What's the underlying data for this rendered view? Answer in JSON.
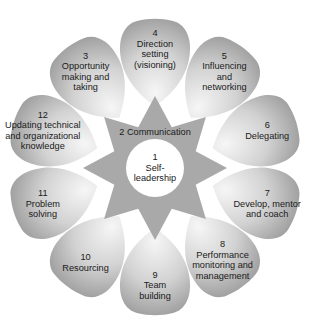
{
  "diagram": {
    "type": "competency-flower",
    "colors": {
      "petal_light": "#f4f4f4",
      "petal_dark": "#9a9a9a",
      "star": "#a8a8a8",
      "center": "#ffffff",
      "text": "#1a1a1a"
    },
    "center": {
      "number": "1",
      "lines": [
        "1",
        "Self-",
        "leadership"
      ]
    },
    "star": {
      "label": "2 Communication"
    },
    "petals": [
      {
        "number": "4",
        "lines": [
          "4",
          "Direction",
          "setting",
          "(visioning)"
        ]
      },
      {
        "number": "5",
        "lines": [
          "5",
          "Influencing",
          "and",
          "networking"
        ]
      },
      {
        "number": "6",
        "lines": [
          "6",
          "Delegating"
        ]
      },
      {
        "number": "7",
        "lines": [
          "7",
          "Develop, mentor",
          "and coach"
        ]
      },
      {
        "number": "8",
        "lines": [
          "8",
          "Performance",
          "monitoring and",
          "management"
        ]
      },
      {
        "number": "9",
        "lines": [
          "9",
          "Team",
          "building"
        ]
      },
      {
        "number": "10",
        "lines": [
          "10",
          "Resourcing"
        ]
      },
      {
        "number": "11",
        "lines": [
          "11",
          "Problem",
          "solving"
        ]
      },
      {
        "number": "12",
        "lines": [
          "12",
          "Updating technical",
          "and organizational",
          "knowledge"
        ]
      },
      {
        "number": "3",
        "lines": [
          "3",
          "Opportunity",
          "making and",
          "taking"
        ]
      }
    ]
  }
}
